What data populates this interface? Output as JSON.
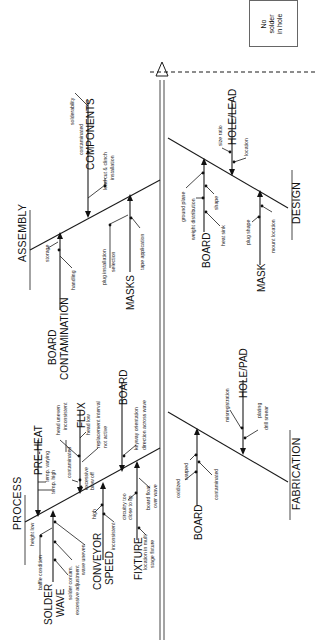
{
  "effect": {
    "label": "No\nsolder\nin hole"
  },
  "categories": {
    "assembly": "ASSEMBLY",
    "process": "PROCESS",
    "design": "DESIGN",
    "fabrication": "FABRICATION"
  },
  "assembly": {
    "components": {
      "label": "COMPONENTS",
      "causes": [
        "solderability",
        "contaminated",
        "lead cut & clinch",
        "installation"
      ]
    },
    "board_contamination": {
      "label_line1": "BOARD",
      "label_line2": "CONTAMINATION",
      "causes": [
        "storage",
        "handling"
      ]
    },
    "masks": {
      "label": "MASKS",
      "causes": [
        "plug installation",
        "selection",
        "tape application"
      ]
    }
  },
  "process": {
    "pre_heat": {
      "label": "PRE-HEAT",
      "causes": [
        "temp. varying",
        "temp. high"
      ]
    },
    "flux": {
      "label": "FLUX",
      "causes": [
        "head uneven",
        "inconsistent",
        "head low",
        "replacement interval",
        "not active",
        "contaminated",
        "excessive",
        "blow off"
      ]
    },
    "board": {
      "label": "BOARD",
      "causes": [
        "keyway orientation",
        "direction across wave"
      ]
    },
    "solder_wave": {
      "label_line1": "SOLDER",
      "label_line2": "WAVE",
      "causes": [
        "height low",
        "baffle condition",
        "solder contam.",
        "excessive adjustment",
        "wave uneven"
      ]
    },
    "conveyor_speed": {
      "label_line1": "CONVEYOR",
      "label_line2": "SPEED",
      "causes": [
        "high",
        "inconsistent"
      ]
    },
    "fixture": {
      "label": "FIXTURE",
      "causes": [
        "circuitry too",
        "close to lip",
        "location in multi",
        "stage fixture",
        "board float",
        "over wave"
      ]
    }
  },
  "design": {
    "hole_lead": {
      "label": "HOLE/LEAD",
      "causes": [
        "size ratio",
        "location"
      ]
    },
    "board": {
      "label": "BOARD",
      "causes": [
        "ground plane",
        "weight distribution",
        "shape",
        "heat sink"
      ]
    },
    "mask": {
      "label": "MASK",
      "causes": [
        "plug shape",
        "mount location"
      ]
    }
  },
  "fabrication": {
    "hole_pad": {
      "label": "HOLE/PAD",
      "causes": [
        "misregistration",
        "plating",
        "drill smear"
      ]
    },
    "board": {
      "label": "BOARD",
      "causes": [
        "oxidized",
        "warped",
        "contaminated"
      ]
    }
  }
}
